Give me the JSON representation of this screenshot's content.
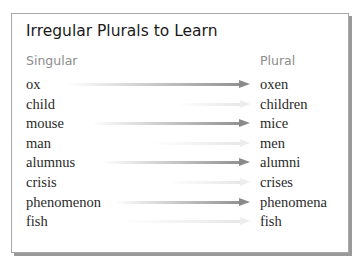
{
  "title": "Irregular Plurals to Learn",
  "columns": {
    "singular": "Singular",
    "plural": "Plural"
  },
  "rows": [
    {
      "singular": "ox",
      "plural": "oxen",
      "arrow": "strong"
    },
    {
      "singular": "child",
      "plural": "children",
      "arrow": "faint"
    },
    {
      "singular": "mouse",
      "plural": "mice",
      "arrow": "strong"
    },
    {
      "singular": "man",
      "plural": "men",
      "arrow": "faint"
    },
    {
      "singular": "alumnus",
      "plural": "alumni",
      "arrow": "strong"
    },
    {
      "singular": "crisis",
      "plural": "crises",
      "arrow": "faint"
    },
    {
      "singular": "phenomenon",
      "plural": "phenomena",
      "arrow": "strong"
    },
    {
      "singular": "fish",
      "plural": "fish",
      "arrow": "faint"
    }
  ],
  "icons": {
    "arrow": "right-arrow-icon"
  }
}
